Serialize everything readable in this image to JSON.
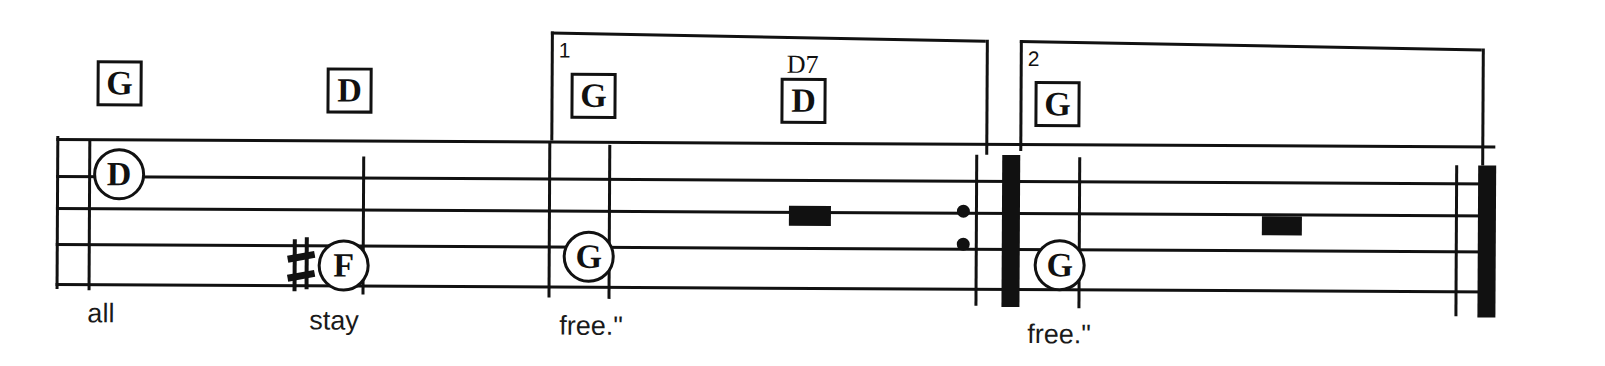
{
  "page": {
    "width": 1605,
    "height": 366,
    "ink_color": "#111111",
    "paper_color": "#ffffff"
  },
  "staff": {
    "line_count": 5,
    "left_x": 56,
    "right_x": 1495,
    "line_y": [
      138,
      175,
      207,
      243,
      283
    ]
  },
  "chords": [
    {
      "label": "G",
      "superscript": "",
      "x": 96,
      "y": 60
    },
    {
      "label": "D",
      "superscript": "",
      "x": 326,
      "y": 66
    },
    {
      "label": "G",
      "superscript": "",
      "x": 570,
      "y": 70
    },
    {
      "label": "D",
      "superscript": "D7",
      "x": 780,
      "y": 74
    },
    {
      "label": "G",
      "superscript": "",
      "x": 1034,
      "y": 76
    }
  ],
  "notes": [
    {
      "letter": "D",
      "x": 93,
      "y": 148,
      "accidental": ""
    },
    {
      "letter": "F",
      "x": 318,
      "y": 238,
      "accidental": "sharp"
    },
    {
      "letter": "G",
      "x": 563,
      "y": 228,
      "accidental": ""
    },
    {
      "letter": "G",
      "x": 1034,
      "y": 234,
      "accidental": ""
    }
  ],
  "note_blocks": [
    {
      "x": 789,
      "y": 202,
      "width": 42,
      "height": 20
    },
    {
      "x": 1262,
      "y": 210,
      "width": 40,
      "height": 19
    }
  ],
  "barlines": [
    {
      "x": 56,
      "top": 136,
      "bottom": 289,
      "kind": "thin"
    },
    {
      "x": 88,
      "top": 140,
      "bottom": 290,
      "kind": "thin"
    },
    {
      "x": 362,
      "top": 155,
      "bottom": 293,
      "kind": "thin"
    },
    {
      "x": 548,
      "top": 139,
      "bottom": 295,
      "kind": "thin"
    },
    {
      "x": 608,
      "top": 142,
      "bottom": 296,
      "kind": "thin"
    },
    {
      "x": 975,
      "top": 150,
      "bottom": 301,
      "kind": "thin"
    },
    {
      "x": 1002,
      "top": 150,
      "bottom": 302,
      "kind": "thick"
    },
    {
      "x": 1078,
      "top": 152,
      "bottom": 303,
      "kind": "thin"
    },
    {
      "x": 1455,
      "top": 158,
      "bottom": 309,
      "kind": "thin"
    },
    {
      "x": 1478,
      "top": 158,
      "bottom": 310,
      "kind": "thick"
    }
  ],
  "repeat_dots": [
    {
      "x": 957,
      "y": 200
    },
    {
      "x": 957,
      "y": 233
    }
  ],
  "voltas": [
    {
      "number": "1",
      "left_x": 550,
      "right_x": 985,
      "top_y": 29,
      "hook_bottom": 138
    },
    {
      "number": "2",
      "left_x": 1019,
      "right_x": 1481,
      "top_y": 35,
      "hook_bottom": 146
    }
  ],
  "lyrics": [
    {
      "text": "all",
      "x": 88,
      "y": 300
    },
    {
      "text": "stay",
      "x": 310,
      "y": 306
    },
    {
      "text": "free.\"",
      "x": 560,
      "y": 310
    },
    {
      "text": "free.\"",
      "x": 1028,
      "y": 316
    }
  ]
}
